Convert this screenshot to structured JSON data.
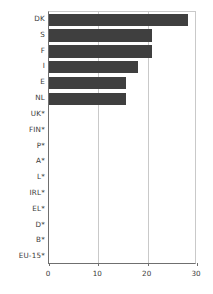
{
  "chart_data": {
    "type": "bar",
    "orientation": "horizontal",
    "title": "",
    "subtitle": "",
    "xlabel": "",
    "ylabel": "",
    "xlim": [
      0,
      30
    ],
    "xticks": [
      0,
      10,
      20,
      30
    ],
    "xtick_labels": [
      "0",
      "10",
      "20",
      "30"
    ],
    "grid": "vertical",
    "legend": "none",
    "bar_color": "#3f3f3f",
    "categories": [
      "DK",
      "S",
      "F",
      "I",
      "E",
      "NL",
      "UK*",
      "FIN*",
      "P*",
      "A*",
      "L*",
      "IRL*",
      "EL*",
      "D*",
      "B*",
      "EU-15*"
    ],
    "values": [
      28.2,
      20.9,
      20.8,
      18.0,
      15.7,
      15.6,
      0,
      0,
      0,
      0,
      0,
      0,
      0,
      0,
      0,
      0
    ],
    "annotations": []
  },
  "axis": {
    "frame_color": "#6f6f6f",
    "grid_color": "#c9c9c9",
    "text_color": "#3a3a3a"
  }
}
